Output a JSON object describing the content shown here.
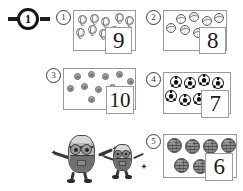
{
  "worksheet": {
    "badge": {
      "label": "1",
      "icon": "circled-number-badge"
    },
    "panels": [
      {
        "number": "1",
        "object_type": "tennis-ball",
        "count": 9,
        "answer": "9",
        "objects": [
          {
            "x": 4,
            "y": 4
          },
          {
            "x": 16,
            "y": 3
          },
          {
            "x": 27,
            "y": 6
          },
          {
            "x": 41,
            "y": 2
          },
          {
            "x": 51,
            "y": 5
          },
          {
            "x": 2,
            "y": 17
          },
          {
            "x": 14,
            "y": 14
          },
          {
            "x": 25,
            "y": 18
          },
          {
            "x": 36,
            "y": 15
          }
        ]
      },
      {
        "number": "2",
        "object_type": "volleyball",
        "count": 8,
        "answer": "8",
        "objects": [
          {
            "x": 12,
            "y": 3
          },
          {
            "x": 25,
            "y": 1
          },
          {
            "x": 38,
            "y": 5
          },
          {
            "x": 50,
            "y": 2
          },
          {
            "x": 2,
            "y": 12
          },
          {
            "x": 16,
            "y": 14
          },
          {
            "x": 29,
            "y": 17
          },
          {
            "x": 42,
            "y": 16
          }
        ]
      },
      {
        "number": "3",
        "object_type": "button-dot",
        "count": 10,
        "answer": "10",
        "objects": [
          {
            "x": 10,
            "y": 4
          },
          {
            "x": 24,
            "y": 2
          },
          {
            "x": 38,
            "y": 4
          },
          {
            "x": 52,
            "y": 2
          },
          {
            "x": 62,
            "y": 9
          },
          {
            "x": 3,
            "y": 14
          },
          {
            "x": 17,
            "y": 13
          },
          {
            "x": 31,
            "y": 15
          },
          {
            "x": 45,
            "y": 13
          },
          {
            "x": 24,
            "y": 24
          }
        ]
      },
      {
        "number": "4",
        "object_type": "soccer-ball",
        "count": 7,
        "answer": "7",
        "objects": [
          {
            "x": 6,
            "y": 3
          },
          {
            "x": 20,
            "y": 4
          },
          {
            "x": 34,
            "y": 1
          },
          {
            "x": 48,
            "y": 4
          },
          {
            "x": 1,
            "y": 16
          },
          {
            "x": 15,
            "y": 19
          },
          {
            "x": 29,
            "y": 18
          }
        ]
      },
      {
        "number": "5",
        "object_type": "textured-ball",
        "count": 6,
        "answer": "6",
        "objects": [
          {
            "x": 3,
            "y": 2
          },
          {
            "x": 21,
            "y": 3
          },
          {
            "x": 39,
            "y": 3
          },
          {
            "x": 57,
            "y": 2
          },
          {
            "x": 10,
            "y": 20
          },
          {
            "x": 29,
            "y": 21
          }
        ]
      }
    ],
    "characters": [
      {
        "name": "minion-large",
        "sparkles": [
          "✦",
          "✦"
        ]
      },
      {
        "name": "minion-small",
        "sparkles": [
          "✦",
          "✦"
        ]
      }
    ]
  }
}
